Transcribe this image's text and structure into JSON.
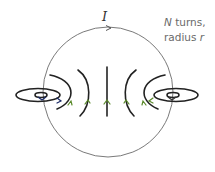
{
  "diagram": {
    "current_label": "I",
    "annotation": {
      "line1_italic": "N",
      "line1_rest": " turns,",
      "line2_rest": "radius ",
      "line2_italic": "r"
    },
    "colors": {
      "loop": "#7a7a7a",
      "field_lines": "#222222",
      "arrows": "#5a8a2a",
      "text": "#6a6a6a"
    },
    "loop": {
      "cx": 108,
      "cy": 92,
      "r": 65
    },
    "field_line_count": 7
  }
}
